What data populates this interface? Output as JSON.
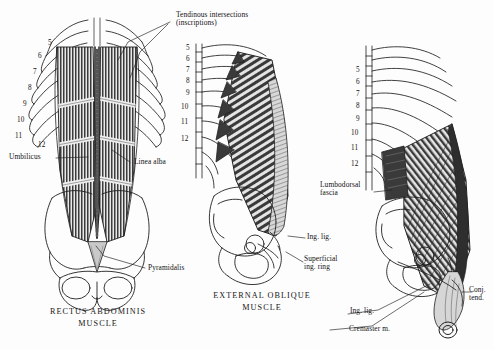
{
  "plate": {
    "background_color": "#fdfdfd",
    "ink_color": "#1a1a1a",
    "muscle_fill": "#4a4a4a",
    "aponeurosis_fill": "#cfcfcf"
  },
  "panels": [
    {
      "id": "rectus",
      "caption": "RECTUS ABDOMINIS\nMUSCLE",
      "rib_numbers": [
        "5",
        "6",
        "7",
        "8",
        "9",
        "10",
        "11",
        "12"
      ],
      "labels": [
        {
          "name": "tendinous-intersections",
          "text": "Tendinous intersections\n(inscriptions)"
        },
        {
          "name": "umbilicus",
          "text": "Umbilicus"
        },
        {
          "name": "linea-alba",
          "text": "Linea alba"
        },
        {
          "name": "pyramidalis",
          "text": "Pyramidalis"
        }
      ]
    },
    {
      "id": "external-oblique",
      "caption": "EXTERNAL OBLIQUE\nMUSCLE",
      "rib_numbers": [
        "5",
        "6",
        "7",
        "8",
        "9",
        "10",
        "11",
        "12"
      ],
      "labels": [
        {
          "name": "inguinal-ligament",
          "text": "Ing. lig."
        },
        {
          "name": "superficial-inguinal-ring",
          "text": "Superficial\ning. ring"
        }
      ]
    },
    {
      "id": "internal-oblique",
      "caption": "",
      "rib_numbers": [
        "5",
        "6",
        "7",
        "8",
        "9",
        "10",
        "11",
        "12"
      ],
      "labels": [
        {
          "name": "lumbodorsal-fascia",
          "text": "Lumbodorsal\nfascia"
        },
        {
          "name": "inguinal-ligament",
          "text": "Ing. lig."
        },
        {
          "name": "conjoined-tendon",
          "text": "Conj.\ntend."
        },
        {
          "name": "cremaster-muscle",
          "text": "Cremaster m."
        }
      ]
    }
  ]
}
